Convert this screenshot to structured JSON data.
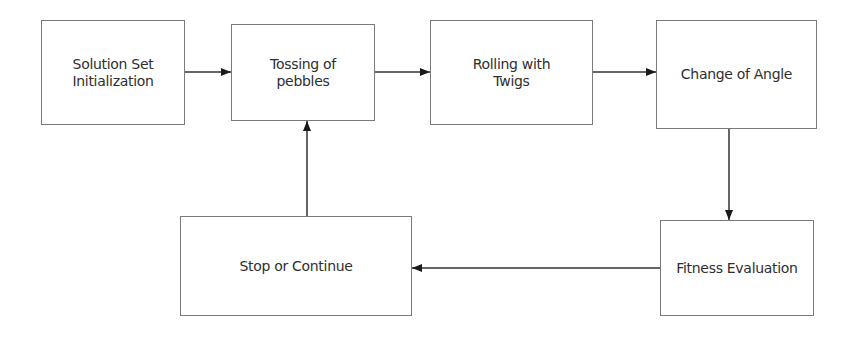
{
  "diagram": {
    "type": "flowchart",
    "nodes": [
      {
        "id": "init",
        "lines": [
          "Solution Set",
          "Initialization"
        ]
      },
      {
        "id": "toss",
        "lines": [
          "Tossing of",
          "pebbles"
        ]
      },
      {
        "id": "roll",
        "lines": [
          "Rolling with",
          "Twigs"
        ]
      },
      {
        "id": "angle",
        "lines": [
          "Change of Angle"
        ]
      },
      {
        "id": "fitness",
        "lines": [
          "Fitness Evaluation"
        ]
      },
      {
        "id": "stop",
        "lines": [
          "Stop or Continue"
        ]
      }
    ],
    "edges": [
      {
        "from": "init",
        "to": "toss"
      },
      {
        "from": "toss",
        "to": "roll"
      },
      {
        "from": "roll",
        "to": "angle"
      },
      {
        "from": "angle",
        "to": "fitness"
      },
      {
        "from": "fitness",
        "to": "stop"
      },
      {
        "from": "stop",
        "to": "toss"
      }
    ],
    "colors": {
      "border": "#7a7a7a",
      "text": "#2e2e2e",
      "arrow": "#1a1a1a"
    }
  }
}
